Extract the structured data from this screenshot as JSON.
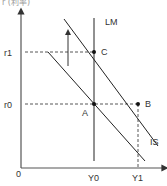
{
  "header": {
    "cutoff_text": "r (利率)"
  },
  "diagram": {
    "type": "IS-LM",
    "axes": {
      "origin_label": "0",
      "x_axis": "Y",
      "y_axis": "r"
    },
    "curves": {
      "lm_label": "LM",
      "is_label": "IS"
    },
    "points": {
      "a": "A",
      "b": "B",
      "c": "C"
    },
    "y_ticks": {
      "r1": "r1",
      "r0": "r0"
    },
    "x_ticks": {
      "y0": "Y0",
      "y1": "Y1"
    },
    "colors": {
      "line": "#222222",
      "axis": "#555555",
      "dash": "#444444"
    }
  }
}
